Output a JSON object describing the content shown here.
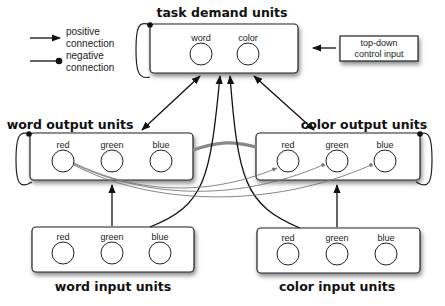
{
  "legend": {
    "positive_line1": "positive",
    "positive_line2": "connection",
    "negative_line1": "negative",
    "negative_line2": "connection"
  },
  "task_demand": {
    "title": "task demand units",
    "units": [
      "word",
      "color"
    ]
  },
  "control_input": {
    "line1": "top-down",
    "line2": "control input"
  },
  "word_output": {
    "title": "word output units",
    "units": [
      "red",
      "green",
      "blue"
    ]
  },
  "color_output": {
    "title": "color output units",
    "units": [
      "red",
      "green",
      "blue"
    ]
  },
  "word_input": {
    "title": "word input units",
    "units": [
      "red",
      "green",
      "blue"
    ]
  },
  "color_input": {
    "title": "color input units",
    "units": [
      "red",
      "green",
      "blue"
    ]
  },
  "colors": {
    "stroke": "#222222",
    "inhibitory_link": "#888888",
    "cross_links": "#777777",
    "shadow": "#999999"
  }
}
